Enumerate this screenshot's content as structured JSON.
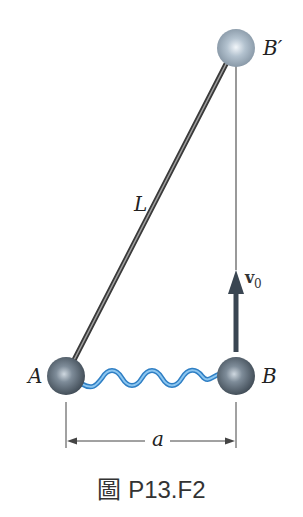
{
  "figure": {
    "caption": "圖 P13.F2",
    "labels": {
      "ball_a": "A",
      "ball_b": "B",
      "ball_b_prime": "B′",
      "rod_length": "L",
      "velocity": "v",
      "velocity_subscript": "0",
      "distance": "a"
    },
    "colors": {
      "ball_dark": "#4d5a66",
      "ball_light": "#9fb0c0",
      "spring": "#5aa9e6",
      "rod": "#555555",
      "arrow": "#3a4652",
      "line": "#444444"
    }
  }
}
